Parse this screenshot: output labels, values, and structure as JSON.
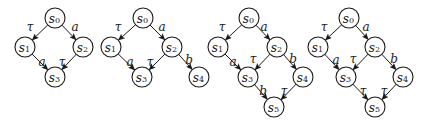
{
  "graphs": [
    {
      "id": "g1",
      "nodes": [
        {
          "id": "s0",
          "label": "s",
          "sub": "0",
          "x": 55,
          "y": 18
        },
        {
          "id": "s1",
          "label": "s",
          "sub": "1",
          "x": 25,
          "y": 47
        },
        {
          "id": "s2",
          "label": "s",
          "sub": "2",
          "x": 83,
          "y": 47
        },
        {
          "id": "s3",
          "label": "s",
          "sub": "3",
          "x": 55,
          "y": 77
        }
      ],
      "edges": [
        {
          "from": "s0",
          "to": "s1",
          "label": "τ",
          "lx": 30,
          "ly": 27
        },
        {
          "from": "s0",
          "to": "s2",
          "label": "a",
          "lx": 75,
          "ly": 27
        },
        {
          "from": "s1",
          "to": "s3",
          "label": "a",
          "lx": 42,
          "ly": 62
        },
        {
          "from": "s2",
          "to": "s3",
          "label": "τ",
          "lx": 62,
          "ly": 62
        }
      ]
    },
    {
      "id": "g2",
      "nodes": [
        {
          "id": "s0",
          "label": "s",
          "sub": "0",
          "x": 143,
          "y": 18
        },
        {
          "id": "s1",
          "label": "s",
          "sub": "1",
          "x": 111,
          "y": 47
        },
        {
          "id": "s2",
          "label": "s",
          "sub": "2",
          "x": 172,
          "y": 47
        },
        {
          "id": "s3",
          "label": "s",
          "sub": "3",
          "x": 142,
          "y": 77
        },
        {
          "id": "s4",
          "label": "s",
          "sub": "4",
          "x": 199,
          "y": 77
        }
      ],
      "edges": [
        {
          "from": "s0",
          "to": "s1",
          "label": "τ",
          "lx": 118,
          "ly": 27
        },
        {
          "from": "s0",
          "to": "s2",
          "label": "a",
          "lx": 162,
          "ly": 27
        },
        {
          "from": "s1",
          "to": "s3",
          "label": "a",
          "lx": 130,
          "ly": 62
        },
        {
          "from": "s2",
          "to": "s3",
          "label": "τ",
          "lx": 150,
          "ly": 62
        },
        {
          "from": "s2",
          "to": "s4",
          "label": "b",
          "lx": 189,
          "ly": 60
        }
      ]
    },
    {
      "id": "g3",
      "nodes": [
        {
          "id": "s0",
          "label": "s",
          "sub": "0",
          "x": 249,
          "y": 18
        },
        {
          "id": "s1",
          "label": "s",
          "sub": "1",
          "x": 218,
          "y": 47
        },
        {
          "id": "s2",
          "label": "s",
          "sub": "2",
          "x": 277,
          "y": 47
        },
        {
          "id": "s3",
          "label": "s",
          "sub": "3",
          "x": 248,
          "y": 77
        },
        {
          "id": "s4",
          "label": "s",
          "sub": "4",
          "x": 303,
          "y": 77
        },
        {
          "id": "s5",
          "label": "s",
          "sub": "5",
          "x": 274,
          "y": 107
        }
      ],
      "edges": [
        {
          "from": "s0",
          "to": "s1",
          "label": "τ",
          "lx": 222,
          "ly": 27
        },
        {
          "from": "s0",
          "to": "s2",
          "label": "a",
          "lx": 264,
          "ly": 27
        },
        {
          "from": "s1",
          "to": "s3",
          "label": "a",
          "lx": 233,
          "ly": 62
        },
        {
          "from": "s2",
          "to": "s3",
          "label": "τ",
          "lx": 253,
          "ly": 59
        },
        {
          "from": "s2",
          "to": "s4",
          "label": "b",
          "lx": 293,
          "ly": 59
        },
        {
          "from": "s3",
          "to": "s5",
          "label": "b",
          "lx": 263,
          "ly": 91
        },
        {
          "from": "s4",
          "to": "s5",
          "label": "τ",
          "lx": 284,
          "ly": 91
        }
      ]
    },
    {
      "id": "g4",
      "nodes": [
        {
          "id": "s0",
          "label": "s",
          "sub": "0",
          "x": 349,
          "y": 18
        },
        {
          "id": "s1",
          "label": "s",
          "sub": "1",
          "x": 318,
          "y": 47
        },
        {
          "id": "s2",
          "label": "s",
          "sub": "2",
          "x": 375,
          "y": 47
        },
        {
          "id": "s3",
          "label": "s",
          "sub": "3",
          "x": 346,
          "y": 77
        },
        {
          "id": "s4",
          "label": "s",
          "sub": "4",
          "x": 403,
          "y": 77
        },
        {
          "id": "s5",
          "label": "s",
          "sub": "5",
          "x": 375,
          "y": 107
        }
      ],
      "edges": [
        {
          "from": "s0",
          "to": "s1",
          "label": "τ",
          "lx": 324,
          "ly": 27
        },
        {
          "from": "s0",
          "to": "s2",
          "label": "a",
          "lx": 366,
          "ly": 27
        },
        {
          "from": "s1",
          "to": "s3",
          "label": "a",
          "lx": 336,
          "ly": 60
        },
        {
          "from": "s2",
          "to": "s3",
          "label": "τ",
          "lx": 353,
          "ly": 59
        },
        {
          "from": "s2",
          "to": "s4",
          "label": "b",
          "lx": 394,
          "ly": 59
        },
        {
          "from": "s3",
          "to": "s5",
          "label": "τ",
          "lx": 363,
          "ly": 91
        },
        {
          "from": "s4",
          "to": "s5",
          "label": "τ",
          "lx": 384,
          "ly": 91
        }
      ]
    }
  ],
  "style": {
    "node_radius": 10,
    "stroke_color": "#1a1a1a",
    "background": "#ffffff"
  }
}
